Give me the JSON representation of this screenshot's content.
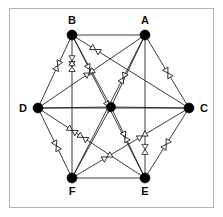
{
  "figure": {
    "type": "graph-diagram",
    "title": "",
    "background_color": "#ffffff",
    "frame_color": "#b3b3b3",
    "edge_color": "#1a1a1a",
    "vertex_color": "#000000",
    "label_color": "#111111"
  },
  "graph_data": {
    "type": "graph",
    "vertex_count": 7,
    "edge_count": 21,
    "vertices": [
      {
        "id": "B",
        "label": "B",
        "cx": 72,
        "cy": 35,
        "r": 5.0,
        "label_x": 72,
        "label_y": 24,
        "labelled": true
      },
      {
        "id": "A",
        "label": "A",
        "cx": 145,
        "cy": 35,
        "r": 5.0,
        "label_x": 145,
        "label_y": 24,
        "labelled": true
      },
      {
        "id": "C",
        "label": "C",
        "cx": 189,
        "cy": 108,
        "r": 5.0,
        "label_x": 200,
        "label_y": 112,
        "labelled": true
      },
      {
        "id": "E",
        "label": "E",
        "cx": 145,
        "cy": 178,
        "r": 5.0,
        "label_x": 145,
        "label_y": 195,
        "labelled": true
      },
      {
        "id": "F",
        "label": "F",
        "cx": 72,
        "cy": 178,
        "r": 5.0,
        "label_x": 72,
        "label_y": 195,
        "labelled": true
      },
      {
        "id": "D",
        "label": "D",
        "cx": 38,
        "cy": 108,
        "r": 5.0,
        "label_x": 27,
        "label_y": 112,
        "labelled": true
      },
      {
        "id": "G",
        "label": "",
        "cx": 111,
        "cy": 107,
        "r": 4.6,
        "label_x": 111,
        "label_y": 107,
        "labelled": false
      }
    ],
    "edges": [
      {
        "from": "B",
        "to": "A",
        "marker": false
      },
      {
        "from": "B",
        "to": "C",
        "marker": true,
        "marker_t": 0.2
      },
      {
        "from": "B",
        "to": "E",
        "marker": true,
        "marker_t": 0.24
      },
      {
        "from": "B",
        "to": "F",
        "marker": true,
        "marker_t": 0.22
      },
      {
        "from": "B",
        "to": "D",
        "marker": true,
        "marker_t": 0.42
      },
      {
        "from": "B",
        "to": "G",
        "marker": false
      },
      {
        "from": "A",
        "to": "C",
        "marker": true,
        "marker_t": 0.52
      },
      {
        "from": "A",
        "to": "E",
        "marker": false
      },
      {
        "from": "A",
        "to": "F",
        "marker": true,
        "marker_t": 0.3
      },
      {
        "from": "A",
        "to": "D",
        "marker": true,
        "marker_t": 0.52
      },
      {
        "from": "A",
        "to": "G",
        "marker": false
      },
      {
        "from": "C",
        "to": "E",
        "marker": true,
        "marker_t": 0.52
      },
      {
        "from": "C",
        "to": "F",
        "marker": true,
        "marker_t": 0.4
      },
      {
        "from": "C",
        "to": "D",
        "marker": false
      },
      {
        "from": "C",
        "to": "G",
        "marker": false
      },
      {
        "from": "E",
        "to": "F",
        "marker": false
      },
      {
        "from": "E",
        "to": "D",
        "marker": true,
        "marker_t": 0.58
      },
      {
        "from": "E",
        "to": "G",
        "marker": true,
        "marker_t": 0.58
      },
      {
        "from": "F",
        "to": "D",
        "marker": true,
        "marker_t": 0.46
      },
      {
        "from": "F",
        "to": "G",
        "marker": false
      },
      {
        "from": "D",
        "to": "G",
        "marker": false
      }
    ],
    "extra_markers": [
      {
        "on_edge": "B-F",
        "t": 0.18,
        "style": "bowtie-vertical"
      },
      {
        "on_edge": "A-E",
        "t": 0.8,
        "style": "bowtie-vertical"
      },
      {
        "on_edge": "B-E",
        "t": 0.5,
        "style": "bowtie"
      },
      {
        "on_edge": "D-E",
        "t": 0.32,
        "style": "bowtie"
      },
      {
        "on_edge": "C-F",
        "t": 0.7,
        "style": "bowtie"
      }
    ],
    "marker": {
      "style": "bowtie",
      "size": 5,
      "fill": "#ffffff",
      "stroke": "#1a1a1a"
    }
  }
}
